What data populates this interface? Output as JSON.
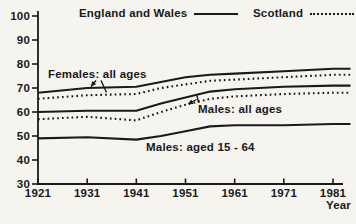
{
  "colors": {
    "ink": "#1a1a1a",
    "paper": "#f5f4ef"
  },
  "legend": {
    "items": [
      {
        "label": "England and Wales",
        "style": "solid"
      },
      {
        "label": "Scotland",
        "style": "dotted"
      }
    ]
  },
  "annotations": {
    "females": {
      "text": "Females: all ages"
    },
    "males": {
      "text": "Males: all ages"
    },
    "males_15_64": {
      "text": "Males: aged 15 - 64"
    }
  },
  "chart_data": {
    "type": "line",
    "title": "",
    "xlabel": "Year",
    "ylabel": "",
    "xlim": [
      1921,
      1984
    ],
    "ylim": [
      30,
      100
    ],
    "grid": false,
    "legend_position": "top",
    "x_ticks": [
      1921,
      1931,
      1941,
      1951,
      1961,
      1971,
      1981
    ],
    "y_ticks": [
      100,
      90,
      80,
      70,
      60,
      50,
      40,
      30
    ],
    "x": [
      1921,
      1931,
      1941,
      1946,
      1951,
      1956,
      1961,
      1971,
      1981
    ],
    "series": [
      {
        "name": "Females: all ages - England and Wales",
        "region": "England and Wales",
        "group": "Females: all ages",
        "line_style": "solid",
        "values": [
          68,
          70,
          70.5,
          72.5,
          74.5,
          75.5,
          76,
          77,
          78
        ]
      },
      {
        "name": "Females: all ages - Scotland",
        "region": "Scotland",
        "group": "Females: all ages",
        "line_style": "dotted",
        "values": [
          65.5,
          67,
          67.5,
          70,
          71.5,
          73,
          73.5,
          74.5,
          75.5
        ]
      },
      {
        "name": "Males: all ages - England and Wales",
        "region": "England and Wales",
        "group": "Males: all ages",
        "line_style": "solid",
        "values": [
          60,
          60.5,
          60.5,
          63.5,
          66,
          68.5,
          69.5,
          70.5,
          71
        ]
      },
      {
        "name": "Males: all ages - Scotland",
        "region": "Scotland",
        "group": "Males: all ages",
        "line_style": "dotted",
        "values": [
          57,
          58,
          56.5,
          60,
          63,
          65.5,
          66.5,
          67.5,
          68
        ]
      },
      {
        "name": "Males: aged 15 - 64 - England and Wales",
        "region": "England and Wales",
        "group": "Males: aged 15 - 64",
        "line_style": "solid",
        "values": [
          49,
          49.5,
          48.5,
          50,
          52,
          54,
          54.5,
          54.5,
          55
        ]
      }
    ]
  }
}
